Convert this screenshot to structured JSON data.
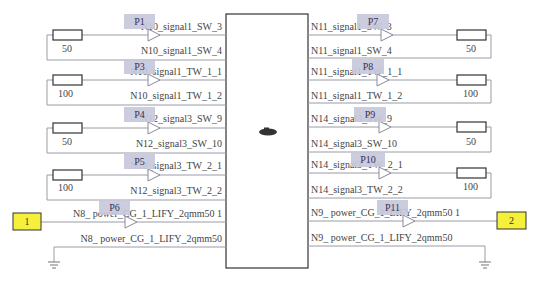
{
  "diagram": {
    "left_nets": [
      {
        "port": "P1",
        "top": "N10_signal1_SW_3",
        "bottom": "N10_signal1_SW_4",
        "resistor": "50"
      },
      {
        "port": "P3",
        "top": "N10_signal1_TW_1_1",
        "bottom": "N10_signal1_TW_1_2",
        "resistor": "100"
      },
      {
        "port": "P4",
        "top": "N12_signal3_SW_9",
        "bottom": "N12_signal3_SW_10",
        "resistor": "50"
      },
      {
        "port": "P5",
        "top": "N12_signal3_TW_2_1",
        "bottom": "N12_signal3_TW_2_2",
        "resistor": "100"
      }
    ],
    "right_nets": [
      {
        "port": "P7",
        "top": "N11_signal1_SW_3",
        "bottom": "N11_signal1_SW_4",
        "resistor": "50"
      },
      {
        "port": "P8",
        "top": "N11_signal1_TW_1_1",
        "bottom": "N11_signal1_TW_1_2",
        "resistor": "100"
      },
      {
        "port": "P9",
        "top": "N14_signal3_SW_9",
        "bottom": "N14_signal3_SW_10",
        "resistor": "50"
      },
      {
        "port": "P10",
        "top": "N14_signal3_TW_2_1",
        "bottom": "N14_signal3_TW_2_2",
        "resistor": "100"
      }
    ],
    "left_power": {
      "port": "P6",
      "top": "N8_ power_CG_1_LIFY_2qmm50 1",
      "bottom": "N8_ power_CG_1_LIFY_2qmm50",
      "connector": "1"
    },
    "right_power": {
      "port": "P11",
      "top": "N9_ power_CG_1_LIFY_2qmm50 1",
      "bottom": "N9_ power_CG_1_LIFY_2qmm50",
      "connector": "2"
    }
  },
  "colors": {
    "connector_fill": "#f5f03a",
    "port_label_bg": "#c8c8dc",
    "wire": "#9a9aa8"
  }
}
